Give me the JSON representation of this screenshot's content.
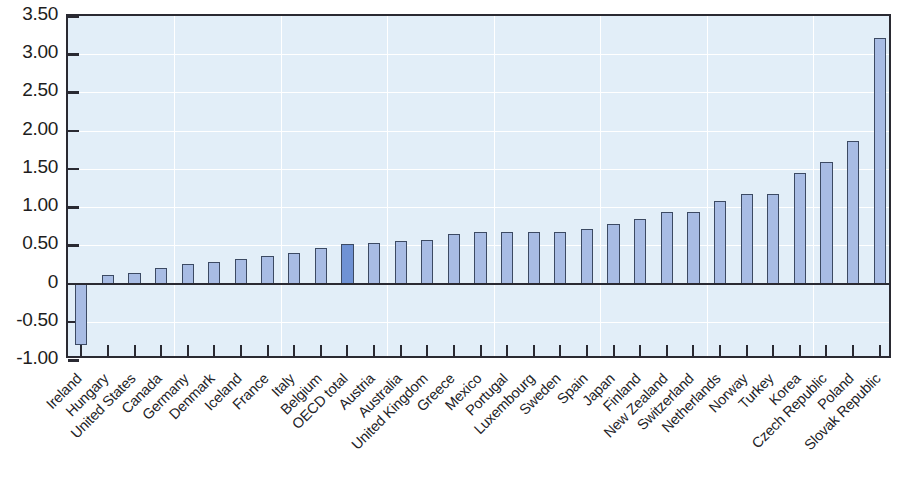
{
  "chart_data": {
    "type": "bar",
    "title": "",
    "subtitle": "",
    "xlabel": "",
    "ylabel": "",
    "ylim": [
      -1.0,
      3.5
    ],
    "grid": true,
    "legend": null,
    "highlight_category": "OECD total",
    "colors": {
      "bar_fill": "#a8bce4",
      "bar_highlight_fill": "#6f92d4",
      "bar_stroke": "#3c4a63",
      "plot_background": "#e2eef8",
      "axis": "#2a2a32",
      "gridline": "#ffffff",
      "text": "#232327"
    },
    "ytick_labels": [
      "3.50",
      "3.00",
      "2.50",
      "2.00",
      "1.50",
      "1.00",
      "0.50",
      "0",
      "-0.50",
      "-1.00"
    ],
    "ytick_values": [
      3.5,
      3.0,
      2.5,
      2.0,
      1.5,
      1.0,
      0.5,
      0,
      -0.5,
      -1.0
    ],
    "categories": [
      "Ireland",
      "Hungary",
      "United States",
      "Canada",
      "Germany",
      "Denmark",
      "Iceland",
      "France",
      "Italy",
      "Belgium",
      "OECD total",
      "Austria",
      "Australia",
      "United Kingdom",
      "Greece",
      "Mexico",
      "Portugal",
      "Luxembourg",
      "Sweden",
      "Spain",
      "Japan",
      "Finland",
      "New Zealand",
      "Switzerland",
      "Netherlands",
      "Norway",
      "Turkey",
      "Korea",
      "Czech Republic",
      "Poland",
      "Slovak Republic"
    ],
    "values": [
      -0.81,
      0.11,
      0.14,
      0.2,
      0.25,
      0.28,
      0.32,
      0.36,
      0.4,
      0.46,
      0.52,
      0.53,
      0.56,
      0.57,
      0.65,
      0.68,
      0.68,
      0.68,
      0.68,
      0.71,
      0.78,
      0.85,
      0.93,
      0.94,
      1.08,
      1.17,
      1.17,
      1.45,
      1.59,
      1.86,
      3.21
    ]
  }
}
